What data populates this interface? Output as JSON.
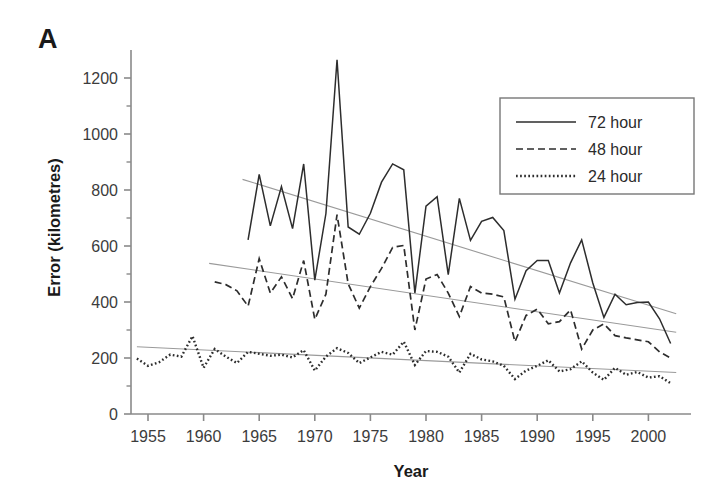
{
  "figure": {
    "panel_letter": "A",
    "xlabel": "Year",
    "ylabel": "Error (kilometres)"
  },
  "legend": {
    "items": [
      {
        "label": "72 hour",
        "style": "solid"
      },
      {
        "label": "48 hour",
        "style": "dashed"
      },
      {
        "label": "24 hour",
        "style": "dotted"
      }
    ]
  },
  "axes": {
    "x_ticks": [
      "1955",
      "1960",
      "1965",
      "1970",
      "1975",
      "1980",
      "1985",
      "1990",
      "1995",
      "2000"
    ],
    "y_ticks": [
      "0",
      "200",
      "400",
      "600",
      "800",
      "1000",
      "1200"
    ]
  },
  "chart_data": {
    "type": "line",
    "title": "",
    "xlabel": "Year",
    "ylabel": "Error (kilometres)",
    "xlim": [
      1954,
      2003
    ],
    "ylim": [
      0,
      1300
    ],
    "y_major_ticks": [
      0,
      200,
      400,
      600,
      800,
      1000,
      1200
    ],
    "y_minor_ticks": [
      100,
      300,
      500,
      700,
      900,
      1100
    ],
    "x_major_ticks": [
      1955,
      1960,
      1965,
      1970,
      1975,
      1980,
      1985,
      1990,
      1995,
      2000
    ],
    "grid": false,
    "legend_position": "top-right",
    "series": [
      {
        "name": "72 hour",
        "style": "solid",
        "x": [
          1964,
          1965,
          1966,
          1967,
          1968,
          1969,
          1970,
          1971,
          1972,
          1973,
          1974,
          1975,
          1976,
          1977,
          1978,
          1979,
          1980,
          1981,
          1982,
          1983,
          1984,
          1985,
          1986,
          1987,
          1988,
          1989,
          1990,
          1991,
          1992,
          1993,
          1994,
          1995,
          1996,
          1997,
          1998,
          1999,
          2000,
          2001,
          2002
        ],
        "values": [
          622,
          856,
          672,
          812,
          662,
          893,
          478,
          716,
          1265,
          668,
          642,
          717,
          828,
          893,
          872,
          432,
          742,
          776,
          498,
          770,
          620,
          688,
          702,
          655,
          410,
          512,
          548,
          548,
          432,
          540,
          622,
          468,
          345,
          428,
          390,
          398,
          400,
          340,
          252
        ],
        "trend": {
          "x": [
            1963.5,
            2002.5
          ],
          "y": [
            838,
            358
          ]
        }
      },
      {
        "name": "48 hour",
        "style": "dashed",
        "x": [
          1961,
          1962,
          1963,
          1964,
          1965,
          1966,
          1967,
          1968,
          1969,
          1970,
          1971,
          1972,
          1973,
          1974,
          1975,
          1976,
          1977,
          1978,
          1979,
          1980,
          1981,
          1982,
          1983,
          1984,
          1985,
          1986,
          1987,
          1988,
          1989,
          1990,
          1991,
          1992,
          1993,
          1994,
          1995,
          1996,
          1997,
          1998,
          1999,
          2000,
          2001,
          2002
        ],
        "values": [
          472,
          462,
          440,
          385,
          555,
          432,
          490,
          412,
          548,
          338,
          428,
          712,
          465,
          378,
          455,
          520,
          595,
          602,
          300,
          482,
          498,
          432,
          348,
          455,
          432,
          428,
          418,
          258,
          352,
          375,
          322,
          330,
          372,
          232,
          300,
          322,
          280,
          272,
          265,
          258,
          222,
          200
        ],
        "trend": {
          "x": [
            1960.5,
            2002.5
          ],
          "y": [
            538,
            292
          ]
        }
      },
      {
        "name": "24 hour",
        "style": "dotted",
        "x": [
          1954,
          1955,
          1956,
          1957,
          1958,
          1959,
          1960,
          1961,
          1962,
          1963,
          1964,
          1965,
          1966,
          1967,
          1968,
          1969,
          1970,
          1971,
          1972,
          1973,
          1974,
          1975,
          1976,
          1977,
          1978,
          1979,
          1980,
          1981,
          1982,
          1983,
          1984,
          1985,
          1986,
          1987,
          1988,
          1989,
          1990,
          1991,
          1992,
          1993,
          1994,
          1995,
          1996,
          1997,
          1998,
          1999,
          2000,
          2001,
          2002
        ],
        "values": [
          198,
          172,
          185,
          212,
          205,
          278,
          165,
          232,
          205,
          182,
          222,
          215,
          208,
          212,
          202,
          228,
          155,
          205,
          235,
          218,
          182,
          202,
          222,
          212,
          258,
          175,
          225,
          222,
          205,
          148,
          215,
          195,
          188,
          172,
          125,
          155,
          172,
          192,
          152,
          160,
          188,
          148,
          122,
          165,
          140,
          150,
          130,
          135,
          110
        ],
        "trend": {
          "x": [
            1954,
            2002.5
          ],
          "y": [
            240,
            148
          ]
        }
      }
    ]
  }
}
